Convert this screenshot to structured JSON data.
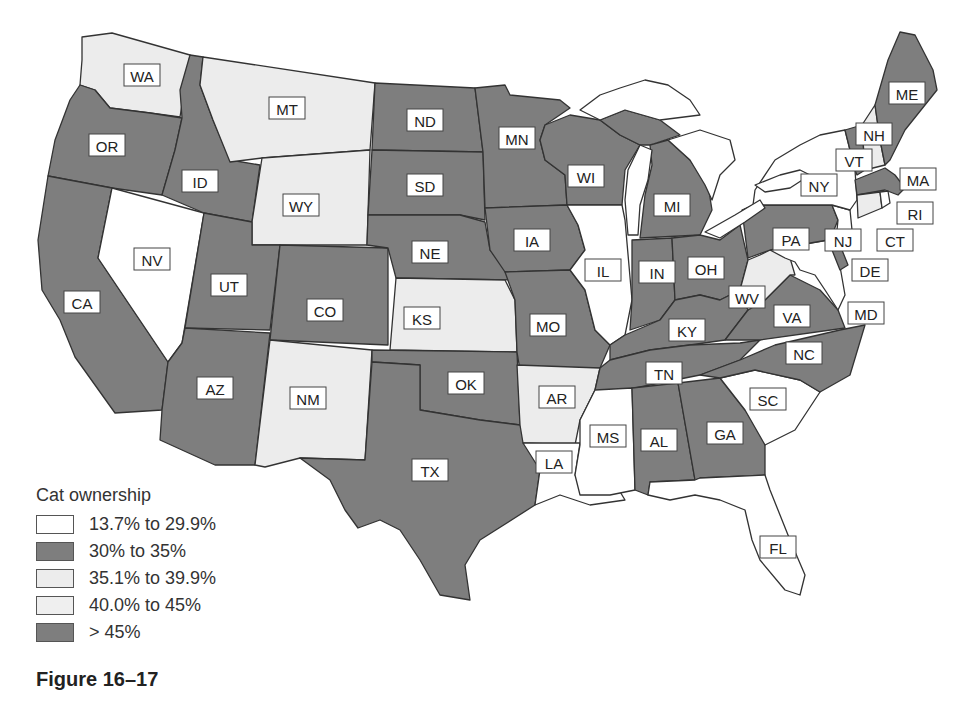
{
  "chart_data": {
    "type": "choropleth-map",
    "title": "Cat ownership",
    "caption": "Figure 16–17",
    "legend_position": "bottom-left",
    "legend": [
      {
        "id": "c1",
        "label": "13.7% to 29.9%",
        "color": "#ffffff"
      },
      {
        "id": "c2",
        "label": "30% to 35%",
        "color": "#7e7e7e"
      },
      {
        "id": "c3",
        "label": "35.1% to 39.9%",
        "color": "#ececec"
      },
      {
        "id": "c4",
        "label": "40.0% to 45%",
        "color": "#efefef"
      },
      {
        "id": "c5",
        "label": "> 45%",
        "color": "#7e7e7e"
      }
    ],
    "states": {
      "WA": "light",
      "OR": "dark",
      "CA": "dark",
      "ID": "dark",
      "NV": "white",
      "MT": "light",
      "WY": "light",
      "UT": "dark",
      "AZ": "dark",
      "CO": "dark",
      "NM": "light",
      "ND": "dark",
      "SD": "dark",
      "NE": "dark",
      "KS": "light",
      "OK": "dark",
      "TX": "dark",
      "MN": "dark",
      "IA": "dark",
      "MO": "dark",
      "AR": "light",
      "LA": "white",
      "WI": "dark",
      "IL": "white",
      "MS": "white",
      "MI": "dark",
      "IN": "dark",
      "OH": "dark",
      "KY": "dark",
      "TN": "dark",
      "AL": "dark",
      "GA": "dark",
      "FL": "white",
      "SC": "white",
      "NC": "dark",
      "VA": "dark",
      "WV": "light",
      "PA": "dark",
      "NY": "white",
      "NJ": "white",
      "DE": "dark",
      "MD": "white",
      "CT": "light",
      "RI": "white",
      "MA": "dark",
      "VT": "dark",
      "NH": "light",
      "ME": "dark"
    }
  },
  "colors": {
    "white": "#ffffff",
    "dark": "#7e7e7e",
    "light": "#ececec"
  },
  "legend": {
    "title": "Cat ownership",
    "items": [
      {
        "label": "13.7% to 29.9%",
        "color": "#ffffff"
      },
      {
        "label": "30% to 35%",
        "color": "#7e7e7e"
      },
      {
        "label": "35.1% to 39.9%",
        "color": "#ececec"
      },
      {
        "label": "40.0% to 45%",
        "color": "#efefef"
      },
      {
        "label": "> 45%",
        "color": "#7e7e7e"
      }
    ]
  },
  "caption": "Figure 16–17",
  "labels": {
    "WA": "WA",
    "OR": "OR",
    "CA": "CA",
    "ID": "ID",
    "NV": "NV",
    "MT": "MT",
    "WY": "WY",
    "UT": "UT",
    "AZ": "AZ",
    "CO": "CO",
    "NM": "NM",
    "ND": "ND",
    "SD": "SD",
    "NE": "NE",
    "KS": "KS",
    "OK": "OK",
    "TX": "TX",
    "MN": "MN",
    "IA": "IA",
    "MO": "MO",
    "AR": "AR",
    "LA": "LA",
    "WI": "WI",
    "IL": "IL",
    "MS": "MS",
    "MI": "MI",
    "IN": "IN",
    "OH": "OH",
    "KY": "KY",
    "TN": "TN",
    "AL": "AL",
    "GA": "GA",
    "FL": "FL",
    "SC": "SC",
    "NC": "NC",
    "VA": "VA",
    "WV": "WV",
    "PA": "PA",
    "NY": "NY",
    "NJ": "NJ",
    "DE": "DE",
    "MD": "MD",
    "CT": "CT",
    "RI": "RI",
    "MA": "MA",
    "VT": "VT",
    "NH": "NH",
    "ME": "ME"
  }
}
